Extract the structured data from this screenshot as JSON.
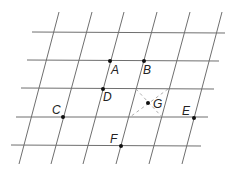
{
  "diagram": {
    "type": "oblique-grid",
    "colors": {
      "grid": "#6f6f6f",
      "dash": "#9a9a9a",
      "point": "#111111",
      "label": "#222222"
    },
    "horizontal_lines": [
      {
        "x1": 32,
        "y1": 32,
        "x2": 225,
        "y2": 33
      },
      {
        "x1": 27,
        "y1": 60,
        "x2": 219,
        "y2": 61
      },
      {
        "x1": 21,
        "y1": 88,
        "x2": 214,
        "y2": 89
      },
      {
        "x1": 16,
        "y1": 117,
        "x2": 208,
        "y2": 117
      },
      {
        "x1": 11,
        "y1": 145,
        "x2": 201,
        "y2": 146
      }
    ],
    "slanted_lines": [
      {
        "x1": 59,
        "y1": 12,
        "x2": 19,
        "y2": 164
      },
      {
        "x1": 92,
        "y1": 12,
        "x2": 51,
        "y2": 164
      },
      {
        "x1": 124,
        "y1": 12,
        "x2": 83,
        "y2": 164
      },
      {
        "x1": 157,
        "y1": 12,
        "x2": 116,
        "y2": 164
      },
      {
        "x1": 190,
        "y1": 12,
        "x2": 149,
        "y2": 164
      },
      {
        "x1": 222,
        "y1": 12,
        "x2": 182,
        "y2": 164
      }
    ],
    "dashed_diagonals": [
      {
        "x1": 136,
        "y1": 89,
        "x2": 162,
        "y2": 117
      },
      {
        "x1": 168,
        "y1": 89,
        "x2": 130,
        "y2": 117
      }
    ],
    "points": [
      {
        "name": "A",
        "x": 110,
        "y": 61,
        "label_x": 111,
        "label_y": 64
      },
      {
        "name": "B",
        "x": 144,
        "y": 61,
        "label_x": 143,
        "label_y": 64
      },
      {
        "name": "C",
        "x": 63,
        "y": 117,
        "label_x": 52,
        "label_y": 104
      },
      {
        "name": "D",
        "x": 103,
        "y": 89,
        "label_x": 103,
        "label_y": 91
      },
      {
        "name": "E",
        "x": 194,
        "y": 118,
        "label_x": 182,
        "label_y": 105
      },
      {
        "name": "F",
        "x": 121,
        "y": 146,
        "label_x": 110,
        "label_y": 133
      },
      {
        "name": "G",
        "x": 148,
        "y": 103,
        "label_x": 153,
        "label_y": 98
      }
    ]
  }
}
